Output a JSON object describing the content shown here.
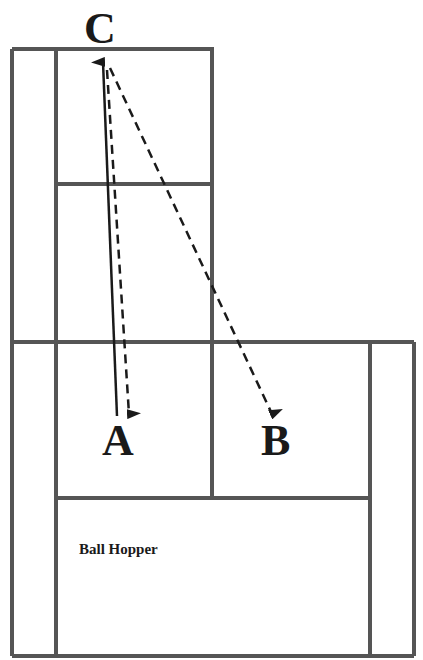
{
  "diagram": {
    "type": "tennis-court-drill",
    "labels": {
      "c": "C",
      "a": "A",
      "b": "B",
      "hopper": "Ball Hopper"
    },
    "paths": [
      {
        "from": "A",
        "to": "C",
        "style": "solid",
        "arrow": "end"
      },
      {
        "from": "C",
        "to": "A",
        "style": "dashed",
        "arrow": "end"
      },
      {
        "from": "C",
        "to": "B",
        "style": "dashed",
        "arrow": "end"
      }
    ],
    "colors": {
      "court_line": "#555555",
      "ink": "#1a1a1a",
      "background": "#ffffff"
    }
  }
}
